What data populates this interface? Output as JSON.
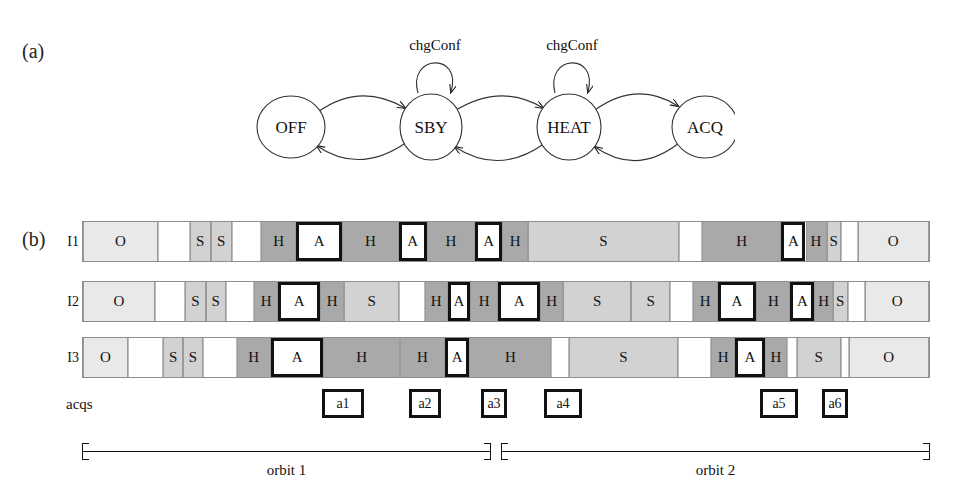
{
  "figure": {
    "panel_a_label": "(a)",
    "panel_b_label": "(b)"
  },
  "state_machine": {
    "states": [
      {
        "id": "off",
        "label": "OFF"
      },
      {
        "id": "sby",
        "label": "SBY"
      },
      {
        "id": "heat",
        "label": "HEAT"
      },
      {
        "id": "acq",
        "label": "ACQ"
      }
    ],
    "self_loops": [
      {
        "on": "sby",
        "label": "chgConf"
      },
      {
        "on": "heat",
        "label": "chgConf"
      }
    ]
  },
  "timelines": {
    "rows": [
      {
        "label": "I1",
        "segments": [
          {
            "state": "O",
            "text": "O",
            "x": 0,
            "w": 89,
            "boxed": false
          },
          {
            "state": "W",
            "text": "",
            "x": 89,
            "w": 38,
            "boxed": false
          },
          {
            "state": "S",
            "text": "S",
            "x": 127,
            "w": 25,
            "boxed": false
          },
          {
            "state": "S",
            "text": "S",
            "x": 152,
            "w": 25,
            "boxed": false
          },
          {
            "state": "W",
            "text": "",
            "x": 177,
            "w": 35,
            "boxed": false
          },
          {
            "state": "H",
            "text": "H",
            "x": 212,
            "w": 42,
            "boxed": false
          },
          {
            "state": "A",
            "text": "A",
            "x": 254,
            "w": 54,
            "boxed": true
          },
          {
            "state": "H",
            "text": "H",
            "x": 308,
            "w": 68,
            "boxed": false
          },
          {
            "state": "A",
            "text": "A",
            "x": 376,
            "w": 33,
            "boxed": true
          },
          {
            "state": "H",
            "text": "H",
            "x": 409,
            "w": 58,
            "boxed": false
          },
          {
            "state": "A",
            "text": "A",
            "x": 467,
            "w": 32,
            "boxed": true
          },
          {
            "state": "H",
            "text": "H",
            "x": 499,
            "w": 31,
            "boxed": false
          },
          {
            "state": "S",
            "text": "S",
            "x": 530,
            "w": 179,
            "boxed": false
          },
          {
            "state": "W",
            "text": "",
            "x": 709,
            "w": 28,
            "boxed": false
          },
          {
            "state": "H",
            "text": "H",
            "x": 737,
            "w": 94,
            "boxed": false
          },
          {
            "state": "A",
            "text": "A",
            "x": 831,
            "w": 29,
            "boxed": true
          },
          {
            "state": "H",
            "text": "H",
            "x": 860,
            "w": 25,
            "boxed": false
          },
          {
            "state": "S",
            "text": "S",
            "x": 885,
            "w": 17,
            "boxed": false
          },
          {
            "state": "W",
            "text": "",
            "x": 902,
            "w": 20,
            "boxed": false
          },
          {
            "state": "O",
            "text": "O",
            "x": 922,
            "w": 85,
            "boxed": false
          }
        ]
      },
      {
        "label": "I2",
        "segments": [
          {
            "state": "O",
            "text": "O",
            "x": 0,
            "w": 89,
            "boxed": false
          },
          {
            "state": "W",
            "text": "",
            "x": 89,
            "w": 38,
            "boxed": false
          },
          {
            "state": "S",
            "text": "S",
            "x": 127,
            "w": 25,
            "boxed": false
          },
          {
            "state": "S",
            "text": "S",
            "x": 152,
            "w": 25,
            "boxed": false
          },
          {
            "state": "W",
            "text": "",
            "x": 177,
            "w": 35,
            "boxed": false
          },
          {
            "state": "H",
            "text": "H",
            "x": 212,
            "w": 30,
            "boxed": false
          },
          {
            "state": "A",
            "text": "A",
            "x": 242,
            "w": 52,
            "boxed": true
          },
          {
            "state": "H",
            "text": "H",
            "x": 294,
            "w": 30,
            "boxed": false
          },
          {
            "state": "S",
            "text": "S",
            "x": 324,
            "w": 68,
            "boxed": false
          },
          {
            "state": "W",
            "text": "",
            "x": 392,
            "w": 32,
            "boxed": false
          },
          {
            "state": "H",
            "text": "H",
            "x": 424,
            "w": 28,
            "boxed": false
          },
          {
            "state": "A",
            "text": "A",
            "x": 452,
            "w": 28,
            "boxed": true
          },
          {
            "state": "H",
            "text": "H",
            "x": 480,
            "w": 35,
            "boxed": false
          },
          {
            "state": "A",
            "text": "A",
            "x": 515,
            "w": 52,
            "boxed": true
          },
          {
            "state": "H",
            "text": "H",
            "x": 567,
            "w": 28,
            "boxed": false
          },
          {
            "state": "S",
            "text": "S",
            "x": 595,
            "w": 85,
            "boxed": false
          },
          {
            "state": "S",
            "text": "S",
            "x": 680,
            "w": 48,
            "boxed": false
          },
          {
            "state": "W",
            "text": "",
            "x": 728,
            "w": 28,
            "boxed": false
          },
          {
            "state": "H",
            "text": "H",
            "x": 756,
            "w": 31,
            "boxed": false
          },
          {
            "state": "A",
            "text": "A",
            "x": 787,
            "w": 48,
            "boxed": true
          },
          {
            "state": "H",
            "text": "H",
            "x": 835,
            "w": 42,
            "boxed": false
          },
          {
            "state": "A",
            "text": "A",
            "x": 877,
            "w": 30,
            "boxed": true
          },
          {
            "state": "H",
            "text": "H",
            "x": 907,
            "w": 23,
            "boxed": false
          },
          {
            "state": "S",
            "text": "S",
            "x": 930,
            "w": 18,
            "boxed": false
          },
          {
            "state": "W",
            "text": "",
            "x": 948,
            "w": 22,
            "boxed": false
          },
          {
            "state": "O",
            "text": "O",
            "x": 970,
            "w": 79,
            "boxed": false
          }
        ]
      },
      {
        "label": "I3",
        "segments": [
          {
            "state": "O",
            "text": "O",
            "x": 0,
            "w": 57,
            "boxed": false
          },
          {
            "state": "W",
            "text": "",
            "x": 57,
            "w": 45,
            "boxed": false
          },
          {
            "state": "S",
            "text": "S",
            "x": 102,
            "w": 25,
            "boxed": false
          },
          {
            "state": "S",
            "text": "S",
            "x": 127,
            "w": 25,
            "boxed": false
          },
          {
            "state": "W",
            "text": "",
            "x": 152,
            "w": 43,
            "boxed": false
          },
          {
            "state": "H",
            "text": "H",
            "x": 195,
            "w": 43,
            "boxed": false
          },
          {
            "state": "A",
            "text": "A",
            "x": 238,
            "w": 67,
            "boxed": true
          },
          {
            "state": "H",
            "text": "H",
            "x": 305,
            "w": 97,
            "boxed": false
          },
          {
            "state": "H",
            "text": "H",
            "x": 402,
            "w": 57,
            "boxed": false
          },
          {
            "state": "A",
            "text": "A",
            "x": 459,
            "w": 31,
            "boxed": true
          },
          {
            "state": "H",
            "text": "H",
            "x": 490,
            "w": 104,
            "boxed": false
          },
          {
            "state": "W",
            "text": "",
            "x": 594,
            "w": 22,
            "boxed": false
          },
          {
            "state": "S",
            "text": "S",
            "x": 616,
            "w": 139,
            "boxed": false
          },
          {
            "state": "W",
            "text": "",
            "x": 755,
            "w": 42,
            "boxed": false
          },
          {
            "state": "H",
            "text": "H",
            "x": 797,
            "w": 30,
            "boxed": false
          },
          {
            "state": "A",
            "text": "A",
            "x": 827,
            "w": 38,
            "boxed": true
          },
          {
            "state": "H",
            "text": "H",
            "x": 865,
            "w": 28,
            "boxed": false
          },
          {
            "state": "W",
            "text": "",
            "x": 893,
            "w": 12,
            "boxed": false
          },
          {
            "state": "S",
            "text": "S",
            "x": 905,
            "w": 56,
            "boxed": false
          },
          {
            "state": "W",
            "text": "",
            "x": 961,
            "w": 10,
            "boxed": false
          },
          {
            "state": "O",
            "text": "O",
            "x": 971,
            "w": 102,
            "boxed": false
          }
        ]
      }
    ],
    "legend": {
      "O": "OFF",
      "S": "SBY",
      "H": "HEAT",
      "A": "ACQ"
    }
  },
  "acqs": {
    "label": "acqs",
    "items": [
      {
        "label": "a1",
        "x": 240,
        "w": 42
      },
      {
        "label": "a2",
        "x": 327,
        "w": 32
      },
      {
        "label": "a3",
        "x": 399,
        "w": 26
      },
      {
        "label": "a4",
        "x": 462,
        "w": 38
      },
      {
        "label": "a5",
        "x": 678,
        "w": 38
      },
      {
        "label": "a6",
        "x": 740,
        "w": 26
      }
    ]
  },
  "orbits": [
    {
      "label": "orbit 1",
      "x": 82,
      "w": 409
    },
    {
      "label": "orbit 2",
      "x": 501,
      "w": 429
    }
  ]
}
